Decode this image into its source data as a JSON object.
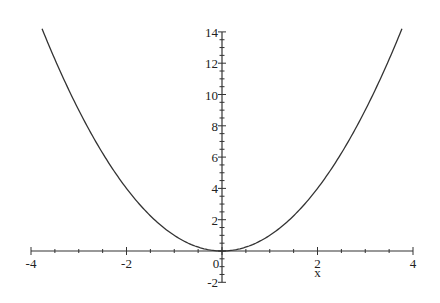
{
  "chart_data": {
    "type": "line",
    "title": "",
    "xlabel": "x",
    "ylabel": "",
    "function": "x^2",
    "xlim": [
      -4,
      4
    ],
    "ylim": [
      -2,
      14
    ],
    "grid": false,
    "legend": null,
    "x_ticks": [
      -4,
      -2,
      0,
      2,
      4
    ],
    "y_ticks": [
      -2,
      0,
      2,
      4,
      6,
      8,
      10,
      12,
      14
    ],
    "series": [
      {
        "name": "x^2",
        "x": [
          -4,
          -3.5,
          -3,
          -2.5,
          -2,
          -1.5,
          -1,
          -0.5,
          0,
          0.5,
          1,
          1.5,
          2,
          2.5,
          3,
          3.5,
          4
        ],
        "values": [
          16,
          12.25,
          9,
          6.25,
          4,
          2.25,
          1,
          0.25,
          0,
          0.25,
          1,
          2.25,
          4,
          6.25,
          9,
          12.25,
          16
        ]
      }
    ],
    "colors": {
      "curve": "#333333",
      "axes": "#333333"
    }
  },
  "labels": {
    "x_tick_labels": [
      "-4",
      "-2",
      "0",
      "2",
      "4"
    ],
    "y_tick_labels": [
      "14",
      "12",
      "10",
      "8",
      "6",
      "4",
      "2",
      "-2"
    ],
    "x_axis_label": "x"
  }
}
